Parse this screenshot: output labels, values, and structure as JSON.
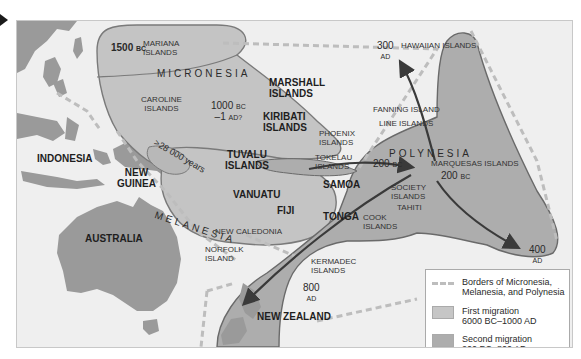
{
  "map": {
    "colors": {
      "ocean": "#efefef",
      "land": "#9a9a9a",
      "first_migration": "#c6c6c6",
      "second_migration": "#adadad",
      "border_dash": "#bdbdbd",
      "arrow": "#3a3a3a"
    },
    "regions": {
      "micronesia": "MICRONESIA",
      "melanesia": "MELANESIA",
      "polynesia": "POLYNESIA"
    },
    "landmasses": {
      "indonesia": "INDONESIA",
      "new_guinea": [
        "NEW",
        "GUINEA"
      ],
      "australia": "AUSTRALIA",
      "new_zealand": "NEW ZEALAND"
    },
    "islands": {
      "mariana": [
        "MARIANA",
        "ISLANDS"
      ],
      "caroline": [
        "CAROLINE",
        "ISLANDS"
      ],
      "marshall": [
        "MARSHALL",
        "ISLANDS"
      ],
      "kiribati": [
        "KIRIBATI",
        "ISLANDS"
      ],
      "tuvalu": [
        "TUVALU",
        "ISLANDS"
      ],
      "vanuatu": "VANUATU",
      "fiji": "FIJI",
      "samoa": "SAMOA",
      "tonga": "TONGA",
      "new_caledonia": "NEW CALEDONIA",
      "norfolk": [
        "NORFOLK",
        "ISLAND"
      ],
      "kermadec": [
        "KERMADEC",
        "ISLANDS"
      ],
      "phoenix": [
        "PHOENIX",
        "ISLANDS"
      ],
      "tokelau": [
        "TOKELAU",
        "ISLANDS"
      ],
      "fanning": "FANNING ISLAND",
      "line": "LINE ISLANDS",
      "hawaiian": "HAWAIIAN ISLANDS",
      "marquesas": "MARQUESAS ISLANDS",
      "society": [
        "SOCIETY",
        "ISLANDS"
      ],
      "tahiti": "TAHITI",
      "cook": [
        "COOK",
        "ISLANDS"
      ],
      "easter": [
        "EASTER",
        "ISLAND"
      ]
    },
    "dates": {
      "mariana": {
        "num": "1500",
        "era": "BC"
      },
      "micronesia_1": {
        "num": "1000",
        "era": "BC"
      },
      "micronesia_2": {
        "num": "–1",
        "era": "AD?"
      },
      "new_guinea_arc": ">28 000 years",
      "tokelau_arrow": {
        "num": "200",
        "era": "BC"
      },
      "marquesas": {
        "num": "200",
        "era": "BC"
      },
      "hawaii": {
        "num": "300",
        "era": "AD"
      },
      "easter": {
        "num": "400",
        "era": "AD"
      },
      "new_zealand": {
        "num": "800",
        "era": "AD"
      }
    }
  },
  "legend": {
    "items": [
      {
        "label_1": "Borders of Micronesia,",
        "label_2": "Melanesia, and Polynesia"
      },
      {
        "label_1": "First migration",
        "label_2": "6000 BC–1000 AD"
      },
      {
        "label_1": "Second migration",
        "label_2": "200 BC–800 AD"
      }
    ]
  }
}
